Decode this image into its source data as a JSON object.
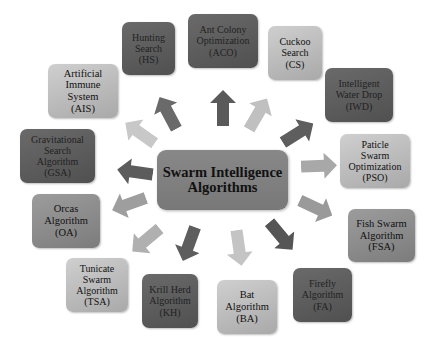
{
  "diagram": {
    "center": {
      "label": "Swarm Intelligence\nAlgorithms"
    },
    "nodes": [
      {
        "id": "hs",
        "label": "Hunting\nSearch\n(HS)"
      },
      {
        "id": "aco",
        "label": "Ant Colony\nOptimization\n(ACO)"
      },
      {
        "id": "cs",
        "label": "Cuckoo\nSearch\n(CS)"
      },
      {
        "id": "iwd",
        "label": "Intelligent\nWater Drop\n(IWD)"
      },
      {
        "id": "pso",
        "label": "Paticle\nSwarm\nOptimization\n(PSO)"
      },
      {
        "id": "fsa",
        "label": "Fish Swarm\nAlgorithm\n(FSA)"
      },
      {
        "id": "fa",
        "label": "Firefly\nAlgorithm\n(FA)"
      },
      {
        "id": "ba",
        "label": "Bat\nAlgorithm\n(BA)"
      },
      {
        "id": "kh",
        "label": "Krill Herd\nAlgorithm\n(KH)"
      },
      {
        "id": "tsa",
        "label": "Tunicate\nSwarm\nAlgorithm\n(TSA)"
      },
      {
        "id": "oa",
        "label": "Orcas\nAlgorithm\n(OA)"
      },
      {
        "id": "gsa",
        "label": "Gravitational\nSearch\nAlgorithm\n(GSA)"
      },
      {
        "id": "ais",
        "label": "Artificial\nImmune\nSystem\n(AIS)"
      }
    ],
    "colors": {
      "dark": "#5a5a5a",
      "mid": "#8a8a8a",
      "light": "#bdbdbd",
      "center": "#808080"
    }
  }
}
